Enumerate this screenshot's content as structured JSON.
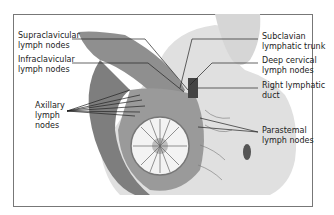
{
  "diagram": {
    "labels": {
      "supraclavicular": [
        "Supraclavicular",
        "lymph nodes"
      ],
      "infraclavicular": [
        "Infraclavicular",
        "lymph nodes"
      ],
      "axillary": [
        "Axillary",
        "lymph",
        "nodes"
      ],
      "subclavian": [
        "Subclavian",
        "lymphatic trunk"
      ],
      "deep_cervical": [
        "Deep cervical",
        "lymph nodes"
      ],
      "right_lymphatic": [
        "Right lymphatic",
        "duct"
      ],
      "parasternal": [
        "Parastemal",
        "lymph nodes"
      ]
    },
    "colors": {
      "frame": "#777777",
      "muscle": "#8a8a8a",
      "skin": "#dcdcdc",
      "gland": "#f2f2f2",
      "lines": "#222222"
    }
  }
}
